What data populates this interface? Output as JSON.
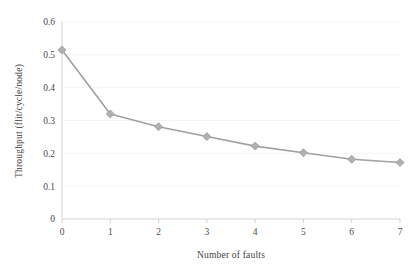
{
  "chart_data": {
    "type": "line",
    "title": "",
    "subtitle": "",
    "xlabel": "Number of faults",
    "ylabel": "Throughput (flit/cycle/node)",
    "x": [
      0,
      1,
      2,
      3,
      4,
      5,
      6,
      7
    ],
    "categories": [
      "0",
      "1",
      "2",
      "3",
      "4",
      "5",
      "6",
      "7"
    ],
    "values": [
      0.515,
      0.32,
      0.281,
      0.251,
      0.222,
      0.202,
      0.182,
      0.172
    ],
    "series": [
      {
        "name": "Throughput",
        "values": [
          0.515,
          0.32,
          0.281,
          0.251,
          0.222,
          0.202,
          0.182,
          0.172
        ]
      }
    ],
    "xlim": [
      0,
      7
    ],
    "ylim": [
      0,
      0.6
    ],
    "xticks": [
      "0",
      "1",
      "2",
      "3",
      "4",
      "5",
      "6",
      "7"
    ],
    "yticks": [
      "0",
      "0.1",
      "0.2",
      "0.3",
      "0.4",
      "0.5",
      "0.6"
    ],
    "ytick_values": [
      0,
      0.1,
      0.2,
      0.3,
      0.4,
      0.5,
      0.6
    ],
    "grid": "horizontal-faint",
    "legend": "none",
    "marker": "diamond",
    "line_color": "#a0a0a0",
    "marker_color": "#b0b0b0",
    "marker_edge_color": "#9a9a9a",
    "axis_color": "#d9d9d9",
    "grid_color": "#f4f4f4",
    "text_color": "#3f3f3f",
    "background": "#ffffff"
  }
}
